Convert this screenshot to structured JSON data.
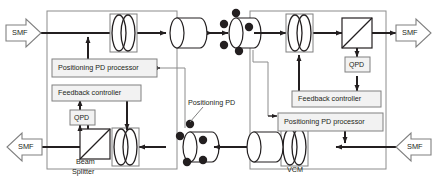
{
  "diagram": {
    "colors": {
      "line": "#231f20",
      "box_fill": "#f2f2f2",
      "box_stroke": "#808080",
      "thin_stroke": "#a6a6a6",
      "dot": "#231f20",
      "background": "#ffffff"
    },
    "ports": [
      {
        "id": "smf-in-left",
        "label": "SMF",
        "direction": "right",
        "position": "top-left"
      },
      {
        "id": "smf-out-left",
        "label": "SMF",
        "direction": "left",
        "position": "bottom-left"
      },
      {
        "id": "smf-out-right",
        "label": "SMF",
        "direction": "right",
        "position": "top-right"
      },
      {
        "id": "smf-in-right",
        "label": "SMF",
        "direction": "left",
        "position": "bottom-right"
      }
    ],
    "left_unit": {
      "name": "Left terminal",
      "blocks": [
        {
          "id": "left-pd-processor",
          "label": "Positioning PD processor"
        },
        {
          "id": "left-feedback",
          "label": "Feedback controller"
        },
        {
          "id": "left-qpd",
          "label": "QPD"
        },
        {
          "id": "left-beam-splitter",
          "label": "Beam\nSplitter",
          "label_line1": "Beam",
          "label_line2": "Splitter"
        }
      ],
      "optics": [
        {
          "id": "left-tx-lens",
          "type": "lens"
        },
        {
          "id": "left-tx-collimator",
          "type": "collimator"
        },
        {
          "id": "left-rx-collimator",
          "type": "collimator"
        },
        {
          "id": "left-rx-lens",
          "type": "lens"
        },
        {
          "id": "left-bs",
          "type": "beam-splitter"
        }
      ]
    },
    "right_unit": {
      "name": "Right terminal",
      "blocks": [
        {
          "id": "right-feedback",
          "label": "Feedback controller"
        },
        {
          "id": "right-pd-processor",
          "label": "Positioning PD processor"
        },
        {
          "id": "right-qpd",
          "label": "QPD"
        },
        {
          "id": "right-vcm",
          "label": "VCM"
        }
      ],
      "optics": [
        {
          "id": "right-rx-collimator",
          "type": "collimator"
        },
        {
          "id": "right-rx-lens",
          "type": "lens"
        },
        {
          "id": "right-bs",
          "type": "beam-splitter"
        },
        {
          "id": "right-tx-collimator",
          "type": "collimator"
        },
        {
          "id": "right-tx-lens",
          "type": "lens"
        }
      ]
    },
    "annotations": [
      {
        "id": "positioning-pd-callout",
        "label": "Positioning PD"
      }
    ]
  }
}
